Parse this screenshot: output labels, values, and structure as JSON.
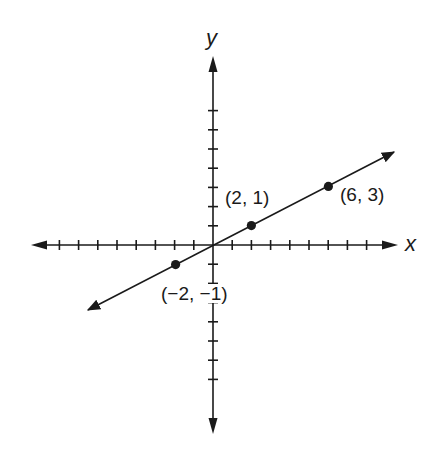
{
  "chart_data": {
    "type": "line",
    "title": "",
    "xlabel": "x",
    "ylabel": "y",
    "xlim": [
      -8,
      8
    ],
    "ylim": [
      -7,
      7
    ],
    "grid": false,
    "tick_step": 1,
    "tick_labels_shown": false,
    "line": {
      "equation": "y = x/2",
      "slope": 0.5,
      "intercept": 0,
      "arrows_both_ends": true
    },
    "points": [
      {
        "x": -2,
        "y": -1,
        "label": "(−2, −1)"
      },
      {
        "x": 2,
        "y": 1,
        "label": "(2, 1)"
      },
      {
        "x": 6,
        "y": 3,
        "label": "(6, 3)"
      }
    ]
  },
  "axes": {
    "x_label": "x",
    "y_label": "y"
  },
  "labels": {
    "p_neg": "(−2, −1)",
    "p_a": "(2, 1)",
    "p_b": "(6, 3)"
  },
  "colors": {
    "ink": "#1a1a1a",
    "background": "#ffffff"
  }
}
